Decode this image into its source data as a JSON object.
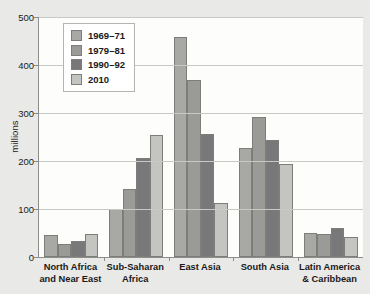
{
  "chart_data": {
    "type": "bar",
    "title": "",
    "xlabel": "",
    "ylabel": "millions",
    "ylim": [
      0,
      500
    ],
    "yticks": [
      0,
      100,
      200,
      300,
      400,
      500
    ],
    "ytick_labels": [
      "0",
      "100",
      "200",
      "300",
      "400",
      "500"
    ],
    "grid": true,
    "legend_position": "upper-left-inside",
    "categories": [
      "North Africa\nand Near East",
      "Sub-Saharan\nAfrica",
      "East Asia",
      "South Asia",
      "Latin America\n& Caribbean"
    ],
    "category_lines": [
      [
        "North Africa",
        "and Near East"
      ],
      [
        "Sub-Saharan",
        "Africa"
      ],
      [
        "East Asia",
        ""
      ],
      [
        "South Asia",
        ""
      ],
      [
        "Latin America",
        "& Caribbean"
      ]
    ],
    "series": [
      {
        "name": "1969–71",
        "color": "#a8a8a4",
        "values": [
          45,
          99,
          458,
          228,
          51
        ]
      },
      {
        "name": "1979–81",
        "color": "#9a9a96",
        "values": [
          27,
          142,
          368,
          292,
          47
        ]
      },
      {
        "name": "1990–92",
        "color": "#78787a",
        "values": [
          33,
          207,
          257,
          243,
          60
        ]
      },
      {
        "name": "2010",
        "color": "#c4c4c0",
        "values": [
          48,
          254,
          113,
          194,
          41
        ]
      }
    ]
  },
  "theme": {
    "page_background": "#e9e9e7",
    "plot_background": "#fdfdfc",
    "axis_color": "#8d8d8a",
    "gridline_color": "#c8c8c4",
    "text_color": "#1a1a1a",
    "legend_background": "#ffffff",
    "legend_border": "#b4b4b0"
  }
}
